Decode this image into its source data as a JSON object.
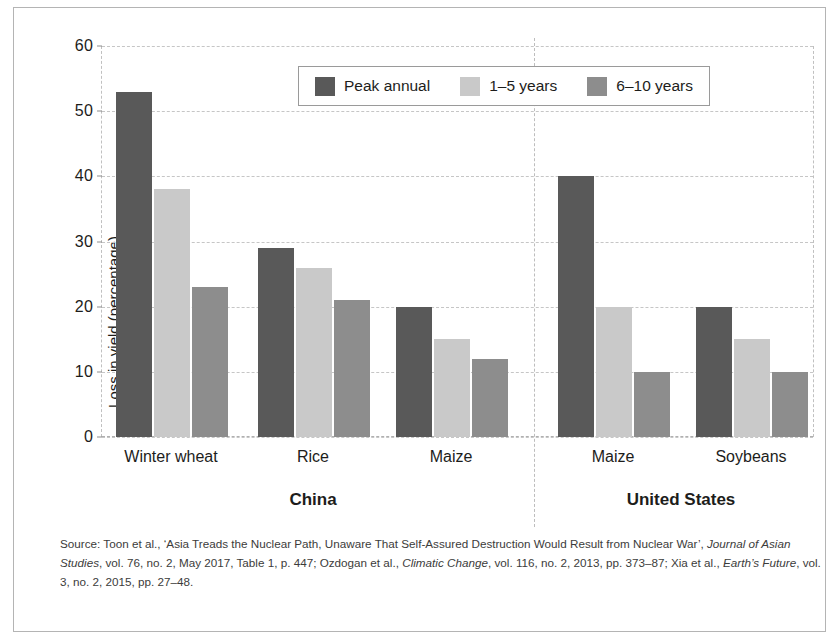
{
  "chart_data": {
    "type": "bar",
    "title": "",
    "subtitle": "",
    "xlabel": "",
    "ylabel": "Loss in yield (percentage)",
    "ylim": [
      0,
      60
    ],
    "ytick_values": [
      0,
      10,
      20,
      30,
      40,
      50,
      60
    ],
    "ytick_labels": [
      "0",
      "10",
      "20",
      "30",
      "40",
      "50",
      "60"
    ],
    "grid": true,
    "legend_position": "top-center",
    "categories": [
      "Winter wheat",
      "Rice",
      "Maize",
      "Maize",
      "Soybeans"
    ],
    "group_labels": [
      "China",
      "United States"
    ],
    "groups": [
      {
        "name": "China",
        "categories": [
          "Winter wheat",
          "Rice",
          "Maize"
        ]
      },
      {
        "name": "United States",
        "categories": [
          "Maize",
          "Soybeans"
        ]
      }
    ],
    "series": [
      {
        "name": "Peak annual",
        "color": "#595959",
        "values": [
          53,
          29,
          20,
          40,
          20
        ]
      },
      {
        "name": "1–5 years",
        "color": "#c9c9c9",
        "values": [
          38,
          26,
          15,
          20,
          15
        ]
      },
      {
        "name": "6–10 years",
        "color": "#8d8d8d",
        "values": [
          23,
          21,
          12,
          10,
          10
        ]
      }
    ]
  },
  "axis": {
    "y_title": "Loss in yield (percentage)",
    "y_ticks": [
      "60",
      "50",
      "40",
      "30",
      "20",
      "10",
      "0"
    ]
  },
  "legend": {
    "items": [
      {
        "label": "Peak annual",
        "color": "#595959"
      },
      {
        "label": "1–5 years",
        "color": "#c9c9c9"
      },
      {
        "label": "6–10 years",
        "color": "#8d8d8d"
      }
    ]
  },
  "x_categories": [
    {
      "label": "Winter wheat"
    },
    {
      "label": "Rice"
    },
    {
      "label": "Maize"
    },
    {
      "label": "Maize"
    },
    {
      "label": "Soybeans"
    }
  ],
  "group_labels": [
    {
      "label": "China"
    },
    {
      "label": "United States"
    }
  ],
  "source": {
    "prefix": "Source: Toon et al., ‘Asia Treads the Nuclear Path, Unaware That Self-Assured Destruction Would Result from Nuclear War’, ",
    "italic1": "Journal of Asian Studies",
    "mid1": ", vol. 76, no. 2, May 2017, Table 1, p. 447; Ozdogan et al., ",
    "italic2": "Climatic Change",
    "mid2": ", vol. 116, no. 2, 2013, pp. 373–87; Xia et al., ",
    "italic3": "Earth’s Future",
    "suffix": ", vol. 3, no. 2, 2015, pp. 27–48."
  }
}
